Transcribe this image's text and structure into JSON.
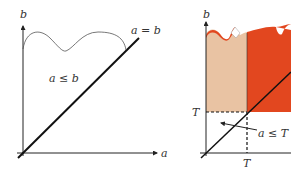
{
  "left_panel": {
    "axis_x_label": "a",
    "axis_y_label": "b",
    "diagonal_label": "a = b",
    "region_label": "a ≤ b"
  },
  "right_panel": {
    "axis_y_label": "b",
    "threshold_y_label": "T",
    "threshold_x_label": "T",
    "region_label": "a ≤ T",
    "colors": {
      "light_region": "#e9c3a3",
      "dark_region": "#e2471f"
    }
  }
}
